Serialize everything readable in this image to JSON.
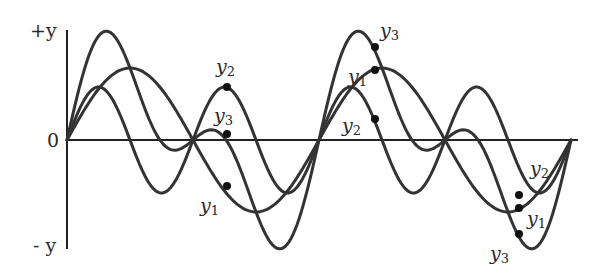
{
  "diagram": {
    "axis": {
      "y_positive_label": "+y",
      "y_negative_label": "- y",
      "origin_label": "0"
    },
    "colors": {
      "curve": "#333333",
      "axis": "#222222",
      "background": "#ffffff"
    }
  },
  "chart_data": {
    "type": "line",
    "title": "",
    "xlabel": "",
    "ylabel": "y",
    "y_tick_labels": [
      "+y",
      "0",
      "- y"
    ],
    "grid": false,
    "legend": "inline labels on curves",
    "series": [
      {
        "name": "y1",
        "description": "component wave, longer wavelength",
        "amplitude": 72,
        "period": 252,
        "phase": 0
      },
      {
        "name": "y2",
        "description": "component wave, half wavelength of y1",
        "amplitude": 53,
        "period": 126,
        "phase": 0
      },
      {
        "name": "y3",
        "description": "resultant y3 = y1 + y2",
        "sum_of": [
          "y1",
          "y2"
        ]
      }
    ],
    "x_range": [
      0,
      504
    ],
    "y_range": [
      -125,
      125
    ],
    "marked_points": [
      {
        "x": 160,
        "labels": [
          {
            "series": "y2",
            "text": "y",
            "sub": "2"
          },
          {
            "series": "y3",
            "text": "y",
            "sub": "3"
          },
          {
            "series": "y1",
            "text": "y",
            "sub": "1"
          }
        ]
      },
      {
        "x": 308,
        "labels": [
          {
            "series": "y3",
            "text": "y",
            "sub": "3"
          },
          {
            "series": "y1",
            "text": "y",
            "sub": "1"
          },
          {
            "series": "y2",
            "text": "y",
            "sub": "2"
          }
        ]
      },
      {
        "x": 452,
        "labels": [
          {
            "series": "y2",
            "text": "y",
            "sub": "2"
          },
          {
            "series": "y1",
            "text": "y",
            "sub": "1"
          },
          {
            "series": "y3",
            "text": "y",
            "sub": "3"
          }
        ]
      }
    ]
  },
  "labels": {
    "l1": {
      "main": "y",
      "sub": "2"
    },
    "l2": {
      "main": "y",
      "sub": "3"
    },
    "l3": {
      "main": "y",
      "sub": "1"
    },
    "l4": {
      "main": "y",
      "sub": "3"
    },
    "l5": {
      "main": "y",
      "sub": "1"
    },
    "l6": {
      "main": "y",
      "sub": "2"
    },
    "l7": {
      "main": "y",
      "sub": "2"
    },
    "l8": {
      "main": "y",
      "sub": "1"
    },
    "l9": {
      "main": "y",
      "sub": "3"
    }
  }
}
